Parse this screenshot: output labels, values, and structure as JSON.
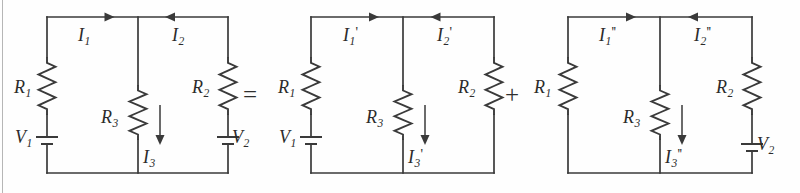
{
  "figure": {
    "kind": "circuit-diagram",
    "background_color": "#fefefe",
    "ink_color": "#3a3a3a",
    "panel_count": 3
  },
  "operators": [
    {
      "name": "equals",
      "symbol": "=",
      "x": 243,
      "y": 82
    },
    {
      "name": "plus",
      "symbol": "+",
      "x": 505,
      "y": 82
    }
  ],
  "circuits": [
    {
      "id": "circuit-original",
      "geometry": {
        "left": 47,
        "mid": 138,
        "right": 228,
        "top": 17,
        "bottom": 173
      },
      "resistors": [
        {
          "name": "R1",
          "label_base": "R",
          "label_sub": "1",
          "label_prime": "",
          "branch": "left",
          "label_x": 14,
          "label_y": 78
        },
        {
          "name": "R3",
          "label_base": "R",
          "label_sub": "3",
          "label_prime": "",
          "branch": "middle",
          "label_x": 101,
          "label_y": 108
        },
        {
          "name": "R2",
          "label_base": "R",
          "label_sub": "2",
          "label_prime": "",
          "branch": "right",
          "label_x": 192,
          "label_y": 78
        }
      ],
      "sources": [
        {
          "name": "V1",
          "label_base": "V",
          "label_sub": "1",
          "branch": "left",
          "y": 137,
          "label_x": 15,
          "label_y": 128
        },
        {
          "name": "V2",
          "label_base": "V",
          "label_sub": "2",
          "branch": "right",
          "y": 137,
          "label_x": 232,
          "label_y": 128
        }
      ],
      "currents": [
        {
          "name": "I1",
          "label_base": "I",
          "label_sub": "1",
          "label_prime": "",
          "direction": "right",
          "label_x": 78,
          "label_y": 26
        },
        {
          "name": "I2",
          "label_base": "I",
          "label_sub": "2",
          "label_prime": "",
          "direction": "left",
          "label_x": 172,
          "label_y": 26
        },
        {
          "name": "I3",
          "label_base": "I",
          "label_sub": "3",
          "label_prime": "",
          "direction": "down",
          "label_x": 143,
          "label_y": 148
        }
      ]
    },
    {
      "id": "circuit-source-v1-only",
      "geometry": {
        "left": 311,
        "mid": 403,
        "right": 494,
        "top": 17,
        "bottom": 173
      },
      "resistors": [
        {
          "name": "R1-prime",
          "label_base": "R",
          "label_sub": "1",
          "label_prime": "",
          "branch": "left",
          "label_x": 278,
          "label_y": 78
        },
        {
          "name": "R3-prime",
          "label_base": "R",
          "label_sub": "3",
          "label_prime": "",
          "branch": "middle",
          "label_x": 366,
          "label_y": 108
        },
        {
          "name": "R2-prime",
          "label_base": "R",
          "label_sub": "2",
          "label_prime": "",
          "branch": "right",
          "label_x": 458,
          "label_y": 78
        }
      ],
      "sources": [
        {
          "name": "V1-prime",
          "label_base": "V",
          "label_sub": "1",
          "branch": "left",
          "y": 137,
          "label_x": 279,
          "label_y": 128
        }
      ],
      "currents": [
        {
          "name": "I1-prime",
          "label_base": "I",
          "label_sub": "1",
          "label_prime": "'",
          "direction": "right",
          "label_x": 343,
          "label_y": 26
        },
        {
          "name": "I2-prime",
          "label_base": "I",
          "label_sub": "2",
          "label_prime": "'",
          "direction": "left",
          "label_x": 437,
          "label_y": 26
        },
        {
          "name": "I3-prime",
          "label_base": "I",
          "label_sub": "3",
          "label_prime": "'",
          "direction": "down",
          "label_x": 408,
          "label_y": 148
        }
      ]
    },
    {
      "id": "circuit-source-v2-only",
      "geometry": {
        "left": 568,
        "mid": 660,
        "right": 752,
        "top": 17,
        "bottom": 173
      },
      "resistors": [
        {
          "name": "R1-double-prime",
          "label_base": "R",
          "label_sub": "1",
          "label_prime": "",
          "branch": "left",
          "label_x": 534,
          "label_y": 78
        },
        {
          "name": "R3-double-prime",
          "label_base": "R",
          "label_sub": "3",
          "label_prime": "",
          "branch": "middle",
          "label_x": 623,
          "label_y": 108
        },
        {
          "name": "R2-double-prime",
          "label_base": "R",
          "label_sub": "2",
          "label_prime": "",
          "branch": "right",
          "label_x": 716,
          "label_y": 78
        }
      ],
      "sources": [
        {
          "name": "V2-double-prime",
          "label_base": "V",
          "label_sub": "2",
          "branch": "right",
          "y": 144,
          "label_x": 757,
          "label_y": 135
        }
      ],
      "currents": [
        {
          "name": "I1-double-prime",
          "label_base": "I",
          "label_sub": "1",
          "label_prime": "''",
          "direction": "right",
          "label_x": 599,
          "label_y": 26
        },
        {
          "name": "I2-double-prime",
          "label_base": "I",
          "label_sub": "2",
          "label_prime": "''",
          "direction": "left",
          "label_x": 694,
          "label_y": 26
        },
        {
          "name": "I3-double-prime",
          "label_base": "I",
          "label_sub": "3",
          "label_prime": "''",
          "direction": "down",
          "label_x": 665,
          "label_y": 148
        }
      ]
    }
  ]
}
